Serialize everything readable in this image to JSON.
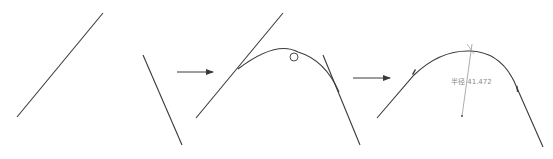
{
  "diagram": {
    "colors": {
      "line": "#3a3a3a",
      "annotation": "#8a8a8a",
      "background": "#ffffff"
    },
    "steps": [
      {
        "id": "step-1",
        "description": "Two separate lines"
      },
      {
        "id": "step-2",
        "description": "Tangent arc drawn between lines"
      },
      {
        "id": "step-3",
        "description": "Trimmed fillet with radius dimension"
      }
    ],
    "arrows": [
      {
        "from": "step-1",
        "to": "step-2"
      },
      {
        "from": "step-2",
        "to": "step-3"
      }
    ],
    "dimension": {
      "label": "半径 41.472"
    }
  }
}
